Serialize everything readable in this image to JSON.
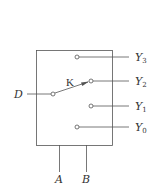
{
  "diagram": {
    "type": "multiplexer-switch (demultiplexer)",
    "switch_label": "K",
    "input": {
      "label": "D"
    },
    "outputs": [
      {
        "label": "Y",
        "sub": "3"
      },
      {
        "label": "Y",
        "sub": "2"
      },
      {
        "label": "Y",
        "sub": "1"
      },
      {
        "label": "Y",
        "sub": "0"
      }
    ],
    "selects": [
      {
        "label": "A"
      },
      {
        "label": "B"
      }
    ],
    "active_output": "Y2",
    "colors": {
      "line": "#555555",
      "text": "#333333",
      "background": "#ffffff"
    }
  }
}
